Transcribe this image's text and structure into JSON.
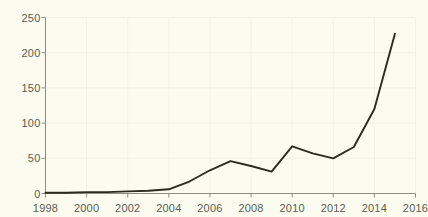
{
  "chart_data": {
    "type": "line",
    "title": "",
    "subtitle": "",
    "xlabel": "",
    "ylabel": "",
    "xlim": [
      1998,
      2016
    ],
    "ylim": [
      0,
      250
    ],
    "grid": true,
    "legend": null,
    "x_ticks": [
      "1998",
      "2000",
      "2002",
      "2004",
      "2006",
      "2008",
      "2010",
      "2012",
      "2014",
      "2016"
    ],
    "x_tick_values": [
      1998,
      2000,
      2002,
      2004,
      2006,
      2008,
      2010,
      2012,
      2014,
      2016
    ],
    "y_ticks": [
      "0",
      "50",
      "100",
      "150",
      "200",
      "250"
    ],
    "y_tick_values": [
      0,
      50,
      100,
      150,
      200,
      250
    ],
    "series": [
      {
        "name": "series-1",
        "color": "#2b2b20",
        "x": [
          1998,
          1999,
          2000,
          2001,
          2002,
          2003,
          2004,
          2005,
          2006,
          2007,
          2008,
          2009,
          2010,
          2011,
          2012,
          2013,
          2014,
          2015
        ],
        "values": [
          1,
          1,
          2,
          2,
          3,
          4,
          6,
          17,
          33,
          46,
          39,
          31,
          67,
          57,
          50,
          66,
          120,
          227
        ]
      }
    ]
  },
  "axes": {
    "x_axis_color": "#8f8f80",
    "y_axis_color": "#8f8f80",
    "grid_color": "#f2f2e4",
    "tick_label_color": "#5c5c52",
    "background_color": "#fbfbf0"
  }
}
